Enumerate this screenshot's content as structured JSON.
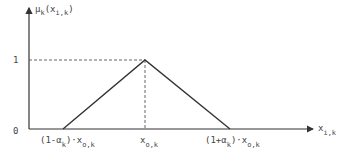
{
  "diagram": {
    "type": "triangular-membership-function",
    "y_axis_label": {
      "main": "μ",
      "sub": "k",
      "arg": "(x",
      "arg_sub": "i,k",
      "close": ")"
    },
    "x_axis_label": {
      "main": "x",
      "sub": "i,k"
    },
    "origin_label": "0",
    "y_tick_label": "1",
    "points": {
      "left_base": {
        "prefix": "(1-α",
        "sub": "k",
        "mid": ")·x",
        "sub2": "o,k"
      },
      "peak": {
        "main": "x",
        "sub": "o,k"
      },
      "right_base": {
        "prefix": "(1+α",
        "sub": "k",
        "mid": ")·x",
        "sub2": "o,k"
      }
    },
    "colors": {
      "line": "#333333",
      "text": "#444444"
    }
  }
}
